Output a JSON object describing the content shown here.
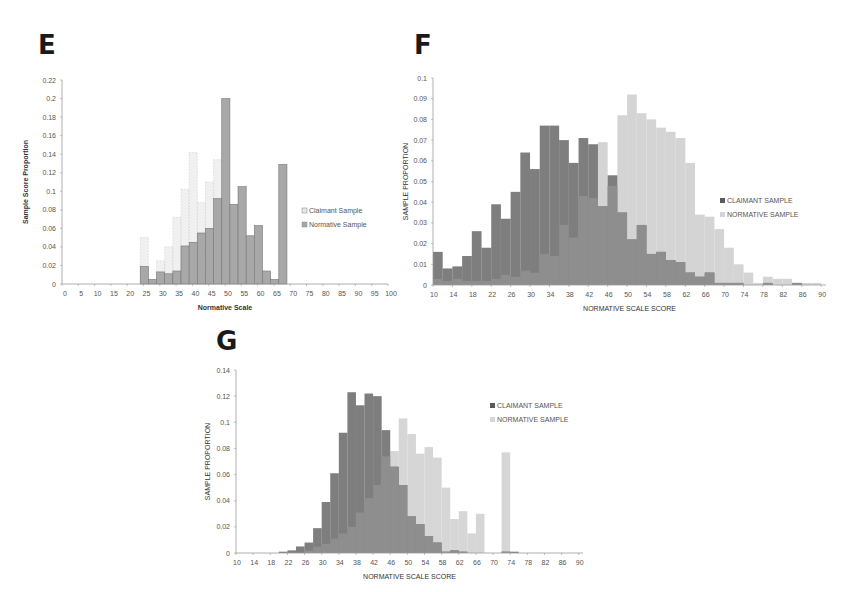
{
  "panels": {
    "E": {
      "letter": "E"
    },
    "F": {
      "letter": "F"
    },
    "G": {
      "letter": "G"
    }
  },
  "chart_data": [
    {
      "id": "E",
      "type": "bar",
      "title": "",
      "xlabel": "Normative Scale",
      "ylabel": "Sample Score Proportion",
      "ylim": [
        0,
        0.22
      ],
      "yticks": [
        0,
        0.02,
        0.04,
        0.06,
        0.08,
        0.1,
        0.12,
        0.14,
        0.16,
        0.18,
        0.2,
        0.22
      ],
      "ytick_labels": [
        "0",
        "0.02",
        "0.04",
        "0.06",
        "0.08",
        "0.1",
        "0.12",
        "0.14",
        "0.16",
        "0.18",
        "0.2",
        "0.22"
      ],
      "xlim": [
        0,
        100
      ],
      "xticks": [
        0,
        5,
        10,
        15,
        20,
        25,
        30,
        35,
        40,
        45,
        50,
        55,
        60,
        65,
        70,
        75,
        80,
        85,
        90,
        95,
        100
      ],
      "grid": false,
      "legend_position": "right",
      "bin_width": 2.5,
      "x": [
        24,
        26.5,
        29,
        31.5,
        34,
        36.5,
        39,
        41.5,
        44,
        46.5,
        49,
        51.5,
        54,
        56.5,
        59,
        61.5,
        64,
        66.5
      ],
      "series": [
        {
          "name": "Claimant Sample",
          "color": "#e6e6e6",
          "values": [
            0.05,
            0.0,
            0.025,
            0.04,
            0.072,
            0.102,
            0.142,
            0.088,
            0.11,
            0.134,
            0.0,
            0.0,
            0.0,
            0.0,
            0.0,
            0.0,
            0.0,
            0.0
          ]
        },
        {
          "name": "Normative Sample",
          "color": "#a8a8a8",
          "values": [
            0.019,
            0.005,
            0.013,
            0.011,
            0.014,
            0.041,
            0.045,
            0.055,
            0.06,
            0.092,
            0.2,
            0.086,
            0.105,
            0.052,
            0.063,
            0.014,
            0.005,
            0.129
          ]
        }
      ]
    },
    {
      "id": "F",
      "type": "bar",
      "title": "",
      "xlabel": "NORMATIVE SCALE SCORE",
      "ylabel": "SAMPLE PROPORTION",
      "ylim": [
        0,
        0.1
      ],
      "yticks": [
        0,
        0.01,
        0.02,
        0.03,
        0.04,
        0.05,
        0.06,
        0.07,
        0.08,
        0.09,
        0.1
      ],
      "ytick_labels": [
        "0",
        "0.01",
        "0.02",
        "0.03",
        "0.04",
        "0.05",
        "0.06",
        "0.07",
        "0.08",
        "0.09",
        "0.1"
      ],
      "xticks": [
        10,
        14,
        18,
        22,
        26,
        30,
        34,
        38,
        42,
        46,
        50,
        54,
        58,
        62,
        66,
        70,
        74,
        78,
        82,
        86,
        90
      ],
      "grid": false,
      "legend_position": "right",
      "bin_width": 2,
      "x": [
        10,
        12,
        14,
        16,
        18,
        20,
        22,
        24,
        26,
        28,
        30,
        32,
        34,
        36,
        38,
        40,
        42,
        44,
        46,
        48,
        50,
        52,
        54,
        56,
        58,
        60,
        62,
        64,
        66,
        68,
        70,
        72,
        74,
        76,
        78,
        80,
        82,
        84,
        86,
        88
      ],
      "series": [
        {
          "name": "CLAIMANT SAMPLE",
          "color": "#5a5a5a",
          "values": [
            0.016,
            0.008,
            0.009,
            0.014,
            0.026,
            0.018,
            0.039,
            0.032,
            0.045,
            0.064,
            0.056,
            0.077,
            0.077,
            0.07,
            0.059,
            0.071,
            0.068,
            0.038,
            0.053,
            0.035,
            0.022,
            0.029,
            0.015,
            0.016,
            0.012,
            0.011,
            0.006,
            0.004,
            0.006,
            0.001,
            0.001,
            0.001,
            0.0,
            0.0,
            0.001,
            0.0,
            0.0,
            0.001,
            0.0,
            0.0
          ]
        },
        {
          "name": "NORMATIVE SAMPLE",
          "color": "#d4d4d4",
          "values": [
            0.003,
            0.002,
            0.003,
            0.002,
            0.002,
            0.002,
            0.003,
            0.005,
            0.004,
            0.007,
            0.006,
            0.015,
            0.014,
            0.029,
            0.023,
            0.043,
            0.042,
            0.069,
            0.048,
            0.082,
            0.092,
            0.083,
            0.08,
            0.076,
            0.074,
            0.071,
            0.059,
            0.034,
            0.033,
            0.027,
            0.018,
            0.01,
            0.006,
            0.001,
            0.004,
            0.003,
            0.003,
            0.001,
            0.001,
            0.001
          ]
        }
      ]
    },
    {
      "id": "G",
      "type": "bar",
      "title": "",
      "xlabel": "NORMATIVE SCALE SCORE",
      "ylabel": "SAMPLE PROPORTION",
      "ylim": [
        0,
        0.14
      ],
      "yticks": [
        0,
        0.02,
        0.04,
        0.06,
        0.08,
        0.1,
        0.12,
        0.14
      ],
      "ytick_labels": [
        "0",
        "0.02",
        "0.04",
        "0.06",
        "0.08",
        "0.1",
        "0.12",
        "0.14"
      ],
      "xticks": [
        10,
        14,
        18,
        22,
        26,
        30,
        34,
        38,
        42,
        46,
        50,
        54,
        58,
        62,
        66,
        70,
        74,
        78,
        82,
        86,
        90
      ],
      "grid": false,
      "legend_position": "right",
      "bin_width": 2,
      "x": [
        10,
        12,
        14,
        16,
        18,
        20,
        22,
        24,
        26,
        28,
        30,
        32,
        34,
        36,
        38,
        40,
        42,
        44,
        46,
        48,
        50,
        52,
        54,
        56,
        58,
        60,
        62,
        64,
        66,
        68,
        70,
        72,
        74,
        76,
        78,
        80,
        82,
        84,
        86,
        88
      ],
      "series": [
        {
          "name": "CLAIMANT SAMPLE",
          "color": "#5a5a5a",
          "values": [
            0.0,
            0.0,
            0.0,
            0.0,
            0.0,
            0.001,
            0.002,
            0.005,
            0.008,
            0.019,
            0.039,
            0.061,
            0.092,
            0.123,
            0.113,
            0.122,
            0.12,
            0.094,
            0.066,
            0.052,
            0.028,
            0.022,
            0.013,
            0.008,
            0.001,
            0.002,
            0.001,
            0.0,
            0.0,
            0.0,
            0.0,
            0.001,
            0.001,
            0.0,
            0.0,
            0.0,
            0.0,
            0.0,
            0.0,
            0.0
          ]
        },
        {
          "name": "NORMATIVE SAMPLE",
          "color": "#d6d6d6",
          "values": [
            0.0,
            0.0,
            0.0,
            0.0,
            0.0,
            0.0,
            0.0,
            0.0,
            0.002,
            0.005,
            0.007,
            0.011,
            0.015,
            0.02,
            0.031,
            0.042,
            0.052,
            0.074,
            0.078,
            0.103,
            0.091,
            0.076,
            0.081,
            0.073,
            0.05,
            0.026,
            0.032,
            0.015,
            0.03,
            0.0,
            0.0,
            0.077,
            0.0,
            0.0,
            0.0,
            0.0,
            0.0,
            0.0,
            0.0,
            0.0
          ]
        }
      ]
    }
  ]
}
